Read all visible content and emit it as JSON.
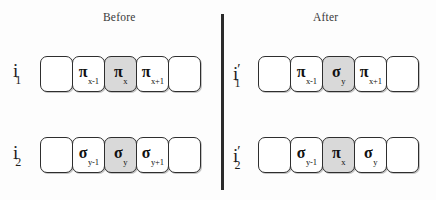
{
  "figure": {
    "panels": [
      {
        "key": "before",
        "title": "Before"
      },
      {
        "key": "after",
        "title": "After"
      }
    ],
    "divider": {
      "orientation": "vertical"
    },
    "colors": {
      "background": "#fdfdfd",
      "cell_fill": "#ffffff",
      "cell_fill_highlight": "#d9d9d9",
      "cell_border": "#2e2e2e",
      "text": "#111111",
      "title_text": "#3a3a3a",
      "divider": "#2b2b2b"
    }
  },
  "rows": [
    {
      "id": "before-row-1",
      "panel": "before",
      "label": {
        "base": "i",
        "prime": "",
        "sub": "1"
      },
      "cells": [
        {
          "symbol": "",
          "index": "",
          "highlight": false
        },
        {
          "symbol": "π",
          "index": "x-1",
          "highlight": false
        },
        {
          "symbol": "π",
          "index": "x",
          "highlight": true
        },
        {
          "symbol": "π",
          "index": "x+1",
          "highlight": false
        },
        {
          "symbol": "",
          "index": "",
          "highlight": false
        }
      ]
    },
    {
      "id": "before-row-2",
      "panel": "before",
      "label": {
        "base": "i",
        "prime": "",
        "sub": "2"
      },
      "cells": [
        {
          "symbol": "",
          "index": "",
          "highlight": false
        },
        {
          "symbol": "σ",
          "index": "y-1",
          "highlight": false
        },
        {
          "symbol": "σ",
          "index": "y",
          "highlight": true
        },
        {
          "symbol": "σ",
          "index": "y+1",
          "highlight": false
        },
        {
          "symbol": "",
          "index": "",
          "highlight": false
        }
      ]
    },
    {
      "id": "after-row-1",
      "panel": "after",
      "label": {
        "base": "i",
        "prime": "′",
        "sub": "1"
      },
      "cells": [
        {
          "symbol": "",
          "index": "",
          "highlight": false
        },
        {
          "symbol": "π",
          "index": "x-1",
          "highlight": false
        },
        {
          "symbol": "σ",
          "index": "y",
          "highlight": true
        },
        {
          "symbol": "π",
          "index": "x+1",
          "highlight": false
        },
        {
          "symbol": "",
          "index": "",
          "highlight": false
        }
      ]
    },
    {
      "id": "after-row-2",
      "panel": "after",
      "label": {
        "base": "i",
        "prime": "′",
        "sub": "2"
      },
      "cells": [
        {
          "symbol": "",
          "index": "",
          "highlight": false
        },
        {
          "symbol": "σ",
          "index": "y-1",
          "highlight": false
        },
        {
          "symbol": "π",
          "index": "x",
          "highlight": true
        },
        {
          "symbol": "σ",
          "index": "y",
          "highlight": false
        },
        {
          "symbol": "",
          "index": "",
          "highlight": false
        }
      ]
    }
  ]
}
